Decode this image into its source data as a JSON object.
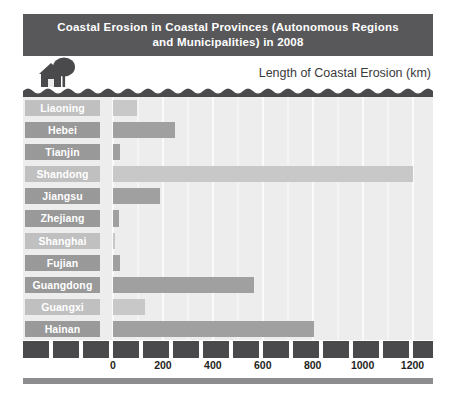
{
  "title": "Coastal Erosion in Coastal Provinces (Autonomous Regions\nand Municipalities) in 2008",
  "axis_title": "Length of Coastal Erosion (km)",
  "icons": {
    "scene": "house-and-tree-icon",
    "water": "wavy-water-icon"
  },
  "colors": {
    "title_band": "#58585a",
    "plot_background": "#ededed",
    "gridline": "#fafafa",
    "bar_light": "#c8c8c8",
    "bar_dark": "#a0a0a0",
    "label_light": "#c0c0c0",
    "label_dark": "#999999",
    "axis_block": "#4a4a4c",
    "tick_text": "#1f1f21"
  },
  "chart_data": {
    "type": "bar",
    "orientation": "horizontal",
    "title": "Coastal Erosion in Coastal Provinces (Autonomous Regions and Municipalities) in 2008",
    "xlabel": "Length of Coastal Erosion (km)",
    "ylabel": "",
    "xlim": [
      0,
      1250
    ],
    "xticks": [
      0,
      200,
      400,
      600,
      800,
      1000,
      1200
    ],
    "xtick_labels": [
      "0",
      "200",
      "400",
      "600",
      "800",
      "1000",
      "1200"
    ],
    "grid": true,
    "legend": false,
    "categories": [
      "Liaoning",
      "Hebei",
      "Tianjin",
      "Shandong",
      "Jiangsu",
      "Zhejiang",
      "Shanghai",
      "Fujian",
      "Guangdong",
      "Guangxi",
      "Hainan"
    ],
    "values": [
      96,
      250,
      30,
      1200,
      190,
      23,
      9,
      27,
      565,
      130,
      805
    ],
    "bars": [
      {
        "label": "Liaoning",
        "value": 96,
        "shade": "light"
      },
      {
        "label": "Hebei",
        "value": 250,
        "shade": "dark"
      },
      {
        "label": "Tianjin",
        "value": 30,
        "shade": "dark"
      },
      {
        "label": "Shandong",
        "value": 1200,
        "shade": "light"
      },
      {
        "label": "Jiangsu",
        "value": 190,
        "shade": "dark"
      },
      {
        "label": "Zhejiang",
        "value": 23,
        "shade": "dark"
      },
      {
        "label": "Shanghai",
        "value": 9,
        "shade": "light"
      },
      {
        "label": "Fujian",
        "value": 27,
        "shade": "dark"
      },
      {
        "label": "Guangdong",
        "value": 565,
        "shade": "dark"
      },
      {
        "label": "Guangxi",
        "value": 130,
        "shade": "light"
      },
      {
        "label": "Hainan",
        "value": 805,
        "shade": "dark"
      }
    ]
  }
}
